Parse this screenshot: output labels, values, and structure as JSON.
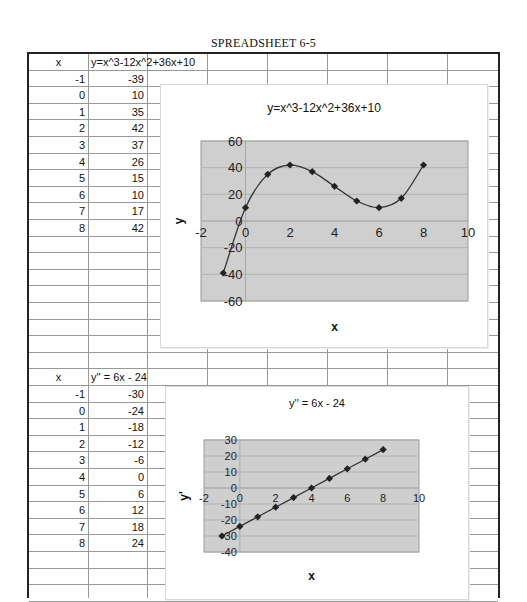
{
  "page": {
    "title": "SPREADSHEET 6-5"
  },
  "table1": {
    "headers": [
      "x",
      "y=x^3-12x^2+36x+10"
    ],
    "rows": [
      [
        "-1",
        "-39"
      ],
      [
        "0",
        "10"
      ],
      [
        "1",
        "35"
      ],
      [
        "2",
        "42"
      ],
      [
        "3",
        "37"
      ],
      [
        "4",
        "26"
      ],
      [
        "5",
        "15"
      ],
      [
        "6",
        "10"
      ],
      [
        "7",
        "17"
      ],
      [
        "8",
        "42"
      ]
    ]
  },
  "table2": {
    "headers": [
      "x",
      "y'' = 6x - 24"
    ],
    "rows": [
      [
        "-1",
        "-30"
      ],
      [
        "0",
        "-24"
      ],
      [
        "1",
        "-18"
      ],
      [
        "2",
        "-12"
      ],
      [
        "3",
        "-6"
      ],
      [
        "4",
        "0"
      ],
      [
        "5",
        "6"
      ],
      [
        "6",
        "12"
      ],
      [
        "7",
        "18"
      ],
      [
        "8",
        "24"
      ]
    ]
  },
  "chart1": {
    "title": "y=x^3-12x^2+36x+10",
    "xlabel": "x",
    "ylabel": "y",
    "xticks": [
      "-2",
      "0",
      "2",
      "4",
      "6",
      "8",
      "10"
    ],
    "yticks": [
      "60",
      "40",
      "20",
      "0",
      "-20",
      "-40",
      "-60"
    ]
  },
  "chart2": {
    "title": "y'' = 6x - 24",
    "xlabel": "x",
    "ylabel": "y'",
    "xticks": [
      "-2",
      "0",
      "2",
      "4",
      "6",
      "8",
      "10"
    ],
    "yticks": [
      "30",
      "20",
      "10",
      "0",
      "-10",
      "-20",
      "-30",
      "-40"
    ]
  },
  "chart_data": [
    {
      "type": "scatter",
      "title": "y=x^3-12x^2+36x+10",
      "xlabel": "x",
      "ylabel": "y",
      "x": [
        -1,
        0,
        1,
        2,
        3,
        4,
        5,
        6,
        7,
        8
      ],
      "series": [
        {
          "name": "y",
          "values": [
            -39,
            10,
            35,
            42,
            37,
            26,
            15,
            10,
            17,
            42
          ]
        }
      ],
      "xlim": [
        -2,
        10
      ],
      "ylim": [
        -60,
        60
      ],
      "grid": true,
      "smoothed_line": true,
      "marker": "diamond"
    },
    {
      "type": "scatter",
      "title": "y'' = 6x - 24",
      "xlabel": "x",
      "ylabel": "y'",
      "x": [
        -1,
        0,
        1,
        2,
        3,
        4,
        5,
        6,
        7,
        8
      ],
      "series": [
        {
          "name": "y''",
          "values": [
            -30,
            -24,
            -18,
            -12,
            -6,
            0,
            6,
            12,
            18,
            24
          ]
        }
      ],
      "xlim": [
        -2,
        10
      ],
      "ylim": [
        -40,
        30
      ],
      "grid": true,
      "marker": "diamond"
    }
  ],
  "colors": {
    "plot_bg": "#cfcfcf",
    "grid": "#b3b3b3",
    "line": "#333333",
    "marker": "#222222"
  }
}
